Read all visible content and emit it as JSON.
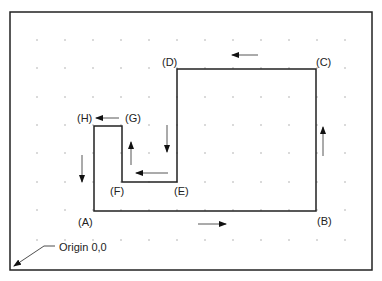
{
  "frame": {
    "x": 10,
    "y": 12,
    "w": 362,
    "h": 258,
    "stroke": "#222222"
  },
  "grid": {
    "xs": [
      37,
      65,
      93,
      121,
      149,
      177,
      205,
      233,
      261,
      289,
      317,
      345
    ],
    "ys": [
      40,
      68,
      97,
      125,
      153,
      182,
      210,
      240
    ],
    "color": "#9a9a9a"
  },
  "path": {
    "points": [
      {
        "id": "A",
        "x": 94,
        "y": 211
      },
      {
        "id": "B",
        "x": 316,
        "y": 211
      },
      {
        "id": "C",
        "x": 316,
        "y": 69
      },
      {
        "id": "D",
        "x": 177,
        "y": 69
      },
      {
        "id": "E",
        "x": 177,
        "y": 182
      },
      {
        "id": "F",
        "x": 122,
        "y": 182
      },
      {
        "id": "G",
        "x": 122,
        "y": 126
      },
      {
        "id": "H",
        "x": 94,
        "y": 126
      }
    ],
    "stroke": "#222222"
  },
  "labels": [
    {
      "text": "(A)",
      "x": 78,
      "y": 226
    },
    {
      "text": "(B)",
      "x": 317,
      "y": 225
    },
    {
      "text": "(C)",
      "x": 316,
      "y": 66
    },
    {
      "text": "(D)",
      "x": 162,
      "y": 66
    },
    {
      "text": "(E)",
      "x": 174,
      "y": 195
    },
    {
      "text": "(F)",
      "x": 110,
      "y": 195
    },
    {
      "text": "(G)",
      "x": 125,
      "y": 122
    },
    {
      "text": "(H)",
      "x": 77,
      "y": 122
    }
  ],
  "arrows": [
    {
      "from": [
        119,
        118
      ],
      "to": [
        96,
        118
      ],
      "name": "arrow-g-to-h"
    },
    {
      "from": [
        82,
        155
      ],
      "to": [
        82,
        182
      ],
      "name": "arrow-h-to-a"
    },
    {
      "from": [
        198,
        224
      ],
      "to": [
        226,
        224
      ],
      "name": "arrow-a-to-b"
    },
    {
      "from": [
        323,
        156
      ],
      "to": [
        323,
        127
      ],
      "name": "arrow-b-to-c"
    },
    {
      "from": [
        258,
        55
      ],
      "to": [
        232,
        55
      ],
      "name": "arrow-c-to-d"
    },
    {
      "from": [
        167,
        125
      ],
      "to": [
        167,
        152
      ],
      "name": "arrow-d-to-e"
    },
    {
      "from": [
        168,
        173
      ],
      "to": [
        136,
        173
      ],
      "name": "arrow-e-to-f"
    },
    {
      "from": [
        131,
        165
      ],
      "to": [
        131,
        142
      ],
      "name": "arrow-f-to-g"
    }
  ],
  "origin": {
    "text": "Origin 0,0",
    "text_x": 59,
    "text_y": 251,
    "leader": [
      [
        55,
        246
      ],
      [
        44,
        246
      ],
      [
        14,
        266
      ]
    ]
  }
}
